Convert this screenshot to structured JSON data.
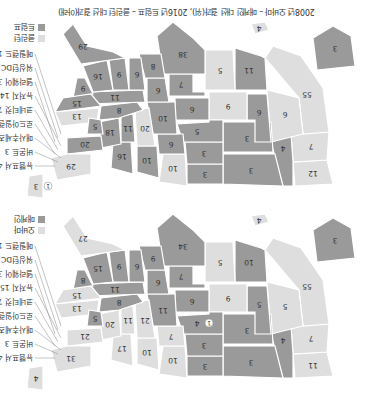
{
  "caption": "2008년 오바마 – 매케인 대선 결과(위), 2016년 트럼프 – 클린턴 대선 결과(아래)",
  "colors": {
    "republican": "#9a9a9a",
    "democrat": "#dedede",
    "border": "#ffffff",
    "text": "#333333"
  },
  "maps": [
    {
      "year": "2008",
      "legend": [
        {
          "label": "오바마",
          "party": "democrat"
        },
        {
          "label": "매케인",
          "party": "republican"
        }
      ],
      "callouts": [
        "뉴햄프셔 4",
        "버몬트 3",
        "매사추세츠 12",
        "로드아일랜드 4",
        "코네티컷 7",
        "뉴저지 15",
        "델라웨어 3",
        "워싱턴DC 3",
        "메릴랜드 10"
      ],
      "states": [
        {
          "name": "WA",
          "ev": "11",
          "party": "democrat"
        },
        {
          "name": "OR",
          "ev": "7",
          "party": "democrat"
        },
        {
          "name": "CA",
          "ev": "55",
          "party": "democrat"
        },
        {
          "name": "ID",
          "ev": "4",
          "party": "republican"
        },
        {
          "name": "NV",
          "ev": "5",
          "party": "democrat"
        },
        {
          "name": "MT",
          "ev": "3",
          "party": "republican"
        },
        {
          "name": "WY",
          "ev": "3",
          "party": "republican"
        },
        {
          "name": "UT",
          "ev": "5",
          "party": "republican"
        },
        {
          "name": "AZ",
          "ev": "10",
          "party": "republican"
        },
        {
          "name": "CO",
          "ev": "9",
          "party": "democrat"
        },
        {
          "name": "NM",
          "ev": "5",
          "party": "democrat"
        },
        {
          "name": "ND",
          "ev": "3",
          "party": "republican"
        },
        {
          "name": "SD",
          "ev": "3",
          "party": "republican"
        },
        {
          "name": "NE",
          "ev": "4",
          "party": "republican",
          "extra": "1"
        },
        {
          "name": "KS",
          "ev": "6",
          "party": "republican"
        },
        {
          "name": "OK",
          "ev": "7",
          "party": "republican"
        },
        {
          "name": "TX",
          "ev": "34",
          "party": "republican"
        },
        {
          "name": "MN",
          "ev": "10",
          "party": "democrat"
        },
        {
          "name": "IA",
          "ev": "7",
          "party": "democrat"
        },
        {
          "name": "MO",
          "ev": "11",
          "party": "republican"
        },
        {
          "name": "AR",
          "ev": "6",
          "party": "republican"
        },
        {
          "name": "LA",
          "ev": "9",
          "party": "republican"
        },
        {
          "name": "WI",
          "ev": "10",
          "party": "democrat"
        },
        {
          "name": "IL",
          "ev": "21",
          "party": "democrat"
        },
        {
          "name": "MI",
          "ev": "17",
          "party": "democrat"
        },
        {
          "name": "IN",
          "ev": "11",
          "party": "democrat"
        },
        {
          "name": "OH",
          "ev": "20",
          "party": "democrat"
        },
        {
          "name": "KY",
          "ev": "8",
          "party": "republican"
        },
        {
          "name": "TN",
          "ev": "11",
          "party": "republican"
        },
        {
          "name": "MS",
          "ev": "6",
          "party": "republican"
        },
        {
          "name": "AL",
          "ev": "9",
          "party": "republican"
        },
        {
          "name": "GA",
          "ev": "15",
          "party": "republican"
        },
        {
          "name": "FL",
          "ev": "27",
          "party": "democrat"
        },
        {
          "name": "SC",
          "ev": "8",
          "party": "republican"
        },
        {
          "name": "NC",
          "ev": "15",
          "party": "democrat"
        },
        {
          "name": "VA",
          "ev": "13",
          "party": "democrat"
        },
        {
          "name": "WV",
          "ev": "5",
          "party": "republican"
        },
        {
          "name": "PA",
          "ev": "21",
          "party": "democrat"
        },
        {
          "name": "NY",
          "ev": "31",
          "party": "democrat"
        },
        {
          "name": "ME",
          "ev": "4",
          "party": "democrat"
        },
        {
          "name": "AK",
          "ev": "3",
          "party": "republican"
        },
        {
          "name": "HI",
          "ev": "4",
          "party": "democrat"
        }
      ]
    },
    {
      "year": "2016",
      "legend": [
        {
          "label": "클린턴",
          "party": "democrat"
        },
        {
          "label": "트럼프",
          "party": "republican"
        }
      ],
      "callouts": [
        "뉴햄프셔 4",
        "버몬트 3",
        "매사추세츠 11",
        "로드아일랜드 4",
        "코네티컷 7",
        "뉴저지 14",
        "델라웨어 3",
        "워싱턴DC 3",
        "메릴랜드 10"
      ],
      "states": [
        {
          "name": "WA",
          "ev": "12",
          "party": "democrat"
        },
        {
          "name": "OR",
          "ev": "7",
          "party": "democrat"
        },
        {
          "name": "CA",
          "ev": "55",
          "party": "democrat"
        },
        {
          "name": "ID",
          "ev": "4",
          "party": "republican"
        },
        {
          "name": "NV",
          "ev": "6",
          "party": "democrat"
        },
        {
          "name": "MT",
          "ev": "3",
          "party": "republican"
        },
        {
          "name": "WY",
          "ev": "3",
          "party": "republican"
        },
        {
          "name": "UT",
          "ev": "6",
          "party": "republican"
        },
        {
          "name": "AZ",
          "ev": "11",
          "party": "republican"
        },
        {
          "name": "CO",
          "ev": "9",
          "party": "democrat"
        },
        {
          "name": "NM",
          "ev": "5",
          "party": "democrat"
        },
        {
          "name": "ND",
          "ev": "3",
          "party": "republican"
        },
        {
          "name": "SD",
          "ev": "3",
          "party": "republican"
        },
        {
          "name": "NE",
          "ev": "5",
          "party": "republican"
        },
        {
          "name": "KS",
          "ev": "6",
          "party": "republican"
        },
        {
          "name": "OK",
          "ev": "7",
          "party": "republican"
        },
        {
          "name": "TX",
          "ev": "38",
          "party": "republican"
        },
        {
          "name": "MN",
          "ev": "10",
          "party": "democrat"
        },
        {
          "name": "IA",
          "ev": "6",
          "party": "republican"
        },
        {
          "name": "MO",
          "ev": "10",
          "party": "republican"
        },
        {
          "name": "AR",
          "ev": "6",
          "party": "republican"
        },
        {
          "name": "LA",
          "ev": "8",
          "party": "republican"
        },
        {
          "name": "WI",
          "ev": "10",
          "party": "republican"
        },
        {
          "name": "IL",
          "ev": "20",
          "party": "democrat"
        },
        {
          "name": "MI",
          "ev": "16",
          "party": "republican"
        },
        {
          "name": "IN",
          "ev": "11",
          "party": "republican"
        },
        {
          "name": "OH",
          "ev": "18",
          "party": "republican"
        },
        {
          "name": "KY",
          "ev": "8",
          "party": "republican"
        },
        {
          "name": "TN",
          "ev": "11",
          "party": "republican"
        },
        {
          "name": "MS",
          "ev": "6",
          "party": "republican"
        },
        {
          "name": "AL",
          "ev": "9",
          "party": "republican"
        },
        {
          "name": "GA",
          "ev": "16",
          "party": "republican"
        },
        {
          "name": "FL",
          "ev": "29",
          "party": "republican"
        },
        {
          "name": "SC",
          "ev": "9",
          "party": "republican"
        },
        {
          "name": "NC",
          "ev": "15",
          "party": "republican"
        },
        {
          "name": "VA",
          "ev": "13",
          "party": "democrat"
        },
        {
          "name": "WV",
          "ev": "5",
          "party": "republican"
        },
        {
          "name": "PA",
          "ev": "20",
          "party": "republican"
        },
        {
          "name": "NY",
          "ev": "29",
          "party": "democrat"
        },
        {
          "name": "ME",
          "ev": "3",
          "party": "democrat",
          "extra": "1"
        },
        {
          "name": "AK",
          "ev": "3",
          "party": "republican"
        },
        {
          "name": "HI",
          "ev": "4",
          "party": "democrat"
        }
      ]
    }
  ]
}
